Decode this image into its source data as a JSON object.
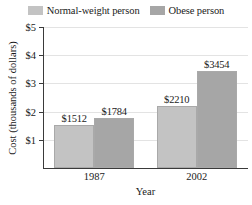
{
  "chart_data": {
    "type": "bar",
    "title": "",
    "xlabel": "Year",
    "ylabel": "Cost (thousands of dollars)",
    "categories": [
      "1987",
      "2002"
    ],
    "series": [
      {
        "name": "Normal-weight person",
        "color": "#c3c3c3",
        "values": [
          1512,
          2210
        ],
        "value_labels": [
          "$1512",
          "$2210"
        ]
      },
      {
        "name": "Obese person",
        "color": "#a6a6a6",
        "values": [
          1784,
          3454
        ],
        "value_labels": [
          "$1784",
          "$3454"
        ]
      }
    ],
    "ylim": [
      0,
      5000
    ],
    "ytick_values": [
      1000,
      2000,
      3000,
      4000,
      5000
    ],
    "ytick_labels": [
      "$1",
      "$2",
      "$3",
      "$4",
      "$5"
    ],
    "grid": true,
    "legend_position": "top-center",
    "value_units": "dollars",
    "y_units": "thousands of dollars"
  }
}
